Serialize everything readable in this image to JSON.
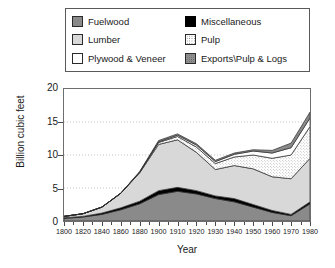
{
  "legend": {
    "entries": [
      {
        "label": "Fuelwood",
        "icon": "legend-swatch-fuelwood",
        "color": "#8a8a8a"
      },
      {
        "label": "Miscellaneous",
        "icon": "legend-swatch-misc",
        "color": "#000000"
      },
      {
        "label": "Lumber",
        "icon": "legend-swatch-lumber",
        "color": "#d8d8d8"
      },
      {
        "label": "Pulp",
        "icon": "legend-swatch-pulp",
        "color": "#ffffff"
      },
      {
        "label": "Plywood & Veneer",
        "icon": "legend-swatch-plywood",
        "color": "#ffffff"
      },
      {
        "label": "Exports\\Pulp & Logs",
        "icon": "legend-swatch-exports",
        "color": "#8f8f8f"
      }
    ]
  },
  "axes": {
    "y_title": "Billion cubic feet",
    "x_title": "Year",
    "y_ticks": [
      "0",
      "5",
      "10",
      "15",
      "20"
    ],
    "x_ticks": [
      "1800",
      "1820",
      "1840",
      "1860",
      "1880",
      "1900",
      "1910",
      "1920",
      "1930",
      "1940",
      "1950",
      "1960",
      "1970",
      "1980"
    ]
  },
  "chart_data": {
    "type": "area",
    "title": "",
    "subtitle": "",
    "xlabel": "Year",
    "ylabel": "Billion cubic feet",
    "xlim": [
      1800,
      1980
    ],
    "ylim": [
      0,
      20
    ],
    "yticks": [
      0,
      5,
      10,
      15,
      20
    ],
    "xticks": [
      1800,
      1820,
      1840,
      1860,
      1880,
      1900,
      1910,
      1920,
      1930,
      1940,
      1950,
      1960,
      1970,
      1980
    ],
    "x_axis_scale": "non-uniform: 20-year steps from 1800 to 1900, then 10-year steps to 1980",
    "grid": "horizontal dotted gridlines at 5, 10, 15",
    "legend_position": "above plot, boxed, two columns",
    "stacked": true,
    "stack_order_bottom_to_top": [
      "Fuelwood",
      "Miscellaneous",
      "Lumber",
      "Pulp",
      "Plywood & Veneer",
      "Exports\\Pulp & Logs"
    ],
    "x": [
      1800,
      1820,
      1840,
      1860,
      1880,
      1900,
      1910,
      1920,
      1930,
      1940,
      1950,
      1960,
      1970,
      1980
    ],
    "series": [
      {
        "name": "Fuelwood",
        "color": "#8a8a8a",
        "values": [
          0.4,
          0.6,
          1.0,
          1.7,
          2.6,
          4.0,
          4.5,
          4.1,
          3.4,
          2.9,
          2.1,
          1.3,
          0.8,
          2.6
        ]
      },
      {
        "name": "Miscellaneous",
        "color": "#000000",
        "values": [
          0.1,
          0.1,
          0.2,
          0.3,
          0.4,
          0.6,
          0.6,
          0.5,
          0.4,
          0.5,
          0.4,
          0.3,
          0.2,
          0.3
        ]
      },
      {
        "name": "Lumber",
        "color": "#d8d8d8",
        "values": [
          0.2,
          0.4,
          0.9,
          2.2,
          4.3,
          7.0,
          7.2,
          5.8,
          4.0,
          5.0,
          5.4,
          5.1,
          5.4,
          6.6
        ]
      },
      {
        "name": "Pulp",
        "color": "#ffffff",
        "values": [
          0.0,
          0.0,
          0.0,
          0.0,
          0.1,
          0.3,
          0.5,
          0.8,
          0.9,
          1.3,
          2.1,
          2.8,
          3.6,
          4.8
        ]
      },
      {
        "name": "Plywood & Veneer",
        "color": "#ffffff",
        "values": [
          0.0,
          0.0,
          0.0,
          0.0,
          0.0,
          0.1,
          0.2,
          0.3,
          0.3,
          0.4,
          0.6,
          0.8,
          1.1,
          1.3
        ]
      },
      {
        "name": "Exports\\Pulp & Logs",
        "color": "#8f8f8f",
        "values": [
          0.0,
          0.0,
          0.0,
          0.0,
          0.1,
          0.2,
          0.2,
          0.2,
          0.2,
          0.2,
          0.2,
          0.4,
          0.7,
          0.9
        ]
      }
    ],
    "totals": [
      0.7,
      1.1,
      2.1,
      4.2,
      7.5,
      12.2,
      13.2,
      11.7,
      9.2,
      10.3,
      10.8,
      10.7,
      11.8,
      16.5
    ],
    "annotations": []
  }
}
